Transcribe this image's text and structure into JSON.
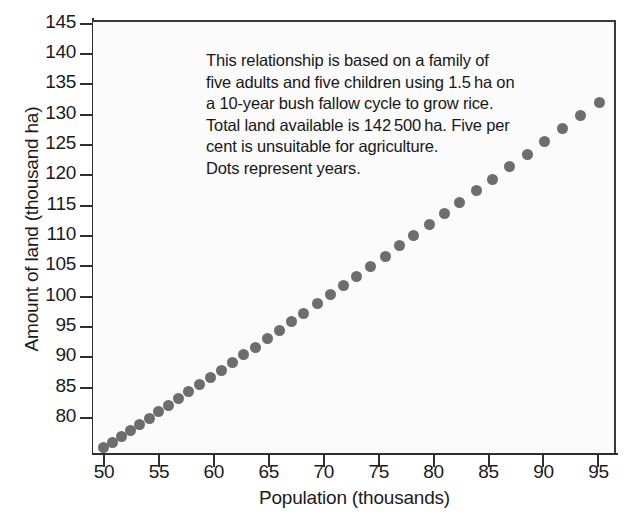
{
  "chart_data": {
    "type": "scatter",
    "title": "",
    "xlabel": "Population (thousands)",
    "ylabel": "Amount of land (thousand ha)",
    "xlim": [
      49.0,
      96.6
    ],
    "ylim": [
      74.2,
      145.6
    ],
    "xticks": [
      50,
      55,
      60,
      65,
      70,
      75,
      80,
      85,
      90,
      95
    ],
    "yticks": [
      80,
      85,
      90,
      95,
      100,
      105,
      110,
      115,
      120,
      125,
      130,
      135,
      140,
      145
    ],
    "xtick_labels": [
      "50",
      "55",
      "60",
      "65",
      "70",
      "75",
      "80",
      "85",
      "90",
      "95"
    ],
    "ytick_labels": [
      "80",
      "85",
      "90",
      "95",
      "100",
      "105",
      "110",
      "115",
      "120",
      "125",
      "130",
      "135",
      "140",
      "145"
    ],
    "grid": false,
    "legend": false,
    "marker": "circle",
    "marker_color": "#6d6d6d",
    "marker_size": 11,
    "series": [
      {
        "name": "Years",
        "x": [
          50.0,
          50.8,
          51.6,
          52.4,
          53.2,
          54.1,
          55.0,
          55.9,
          56.8,
          57.7,
          58.7,
          59.7,
          60.7,
          61.7,
          62.7,
          63.8,
          64.9,
          66.0,
          67.1,
          68.2,
          69.4,
          70.6,
          71.8,
          73.0,
          74.3,
          75.6,
          76.9,
          78.2,
          79.6,
          81.0,
          82.4,
          83.9,
          85.4,
          86.9,
          88.5,
          90.1,
          91.7,
          93.4,
          95.1
        ],
        "y": [
          75.5,
          76.3,
          77.3,
          78.3,
          79.2,
          80.3,
          81.3,
          82.4,
          83.5,
          84.6,
          85.8,
          87.0,
          88.2,
          89.4,
          90.7,
          92.0,
          93.4,
          94.8,
          96.2,
          97.6,
          99.1,
          100.6,
          102.1,
          103.7,
          105.3,
          107.0,
          108.7,
          110.4,
          112.2,
          114.0,
          115.9,
          117.8,
          119.7,
          121.7,
          123.8,
          125.9,
          128.0,
          130.2,
          132.4
        ],
        "note": "One dot per year; near-linear growth of land required with population"
      }
    ],
    "annotations": [
      "This relationship is based on a family of",
      "five adults and five children using 1.5 ha on",
      "a 10-year bush fallow cycle to grow rice.",
      "Total land available is 142 500 ha. Five per",
      "cent is unsuitable for agriculture.",
      "Dots represent years."
    ]
  },
  "figure": {
    "background_color": "#ffffff",
    "plot_background_color": "#fbfbfb",
    "axis_color": "#2e2e2e",
    "text_color": "#1b1b1b"
  }
}
